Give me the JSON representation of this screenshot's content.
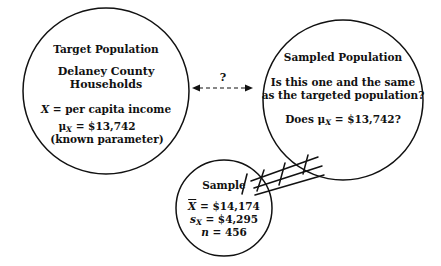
{
  "diagram": {
    "background_color": "#ffffff",
    "stroke_color": "#111111"
  },
  "target_population": {
    "title": "Target Population",
    "subtitle_line1": "Delaney County",
    "subtitle_line2": "Households",
    "variable_symbol": "X",
    "variable_definition": "= per capita income",
    "parameter_symbol": "μ",
    "parameter_subscript": "X",
    "parameter_value": "= $13,742",
    "parameter_note": "(known parameter)",
    "circle": {
      "cx": 106,
      "cy": 91,
      "r": 83
    }
  },
  "sampled_population": {
    "title": "Sampled Population",
    "question_line1": "Is this one and the same",
    "question_line2": "as the targeted population?",
    "does_prefix": "Does",
    "does_symbol": "μ",
    "does_subscript": "X",
    "does_value": "= $13,742?",
    "circle": {
      "cx": 343,
      "cy": 100,
      "r": 80
    }
  },
  "sample": {
    "title": "Sample",
    "mean_symbol": "X",
    "mean_value": "= $14,174",
    "sd_symbol": "s",
    "sd_subscript": "X",
    "sd_value": "= $4,295",
    "n_symbol": "n",
    "n_value": "= 456",
    "circle": {
      "cx": 224,
      "cy": 208,
      "r": 48
    }
  },
  "connectors": {
    "question_mark": "?",
    "comparison_arrow": "double-headed-dashed-arrow",
    "sampling_lines_count": 3
  }
}
